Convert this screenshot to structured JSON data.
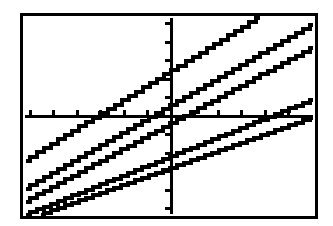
{
  "app": {
    "kind": "graphing-calculator-screen",
    "background_color": "#ffffff",
    "ink_color": "#000000",
    "frame_border_color": "#000000"
  },
  "screen": {
    "frame_left": 20,
    "frame_top": 13,
    "frame_width": 298,
    "frame_height": 206,
    "border_width": 3
  },
  "chart_data": {
    "type": "line",
    "title": "",
    "subtitle": "",
    "xlabel": "",
    "ylabel": "",
    "grid": false,
    "legend": "none",
    "axes": {
      "x_axis_visible": true,
      "y_axis_visible": true,
      "x_axis_pixel_y": 100,
      "y_axis_pixel_x": 148,
      "xlim": [
        -10,
        10
      ],
      "ylim": [
        -10,
        10
      ],
      "x_tick_step": 1.6,
      "y_tick_step": 1.9,
      "x_tick_count": 13,
      "y_tick_count": 11,
      "tick_length_px": 6
    },
    "series": [
      {
        "name": "line-1",
        "slope": 0.62,
        "intercept": 2.2,
        "px_start": [
          3,
          145
        ],
        "px_end": [
          237,
          2
        ],
        "exits": "right-edge-top"
      },
      {
        "name": "line-2",
        "slope": 0.62,
        "intercept": 0.45,
        "px_start": [
          3,
          173
        ],
        "px_end": [
          290,
          9
        ],
        "exits": "right-edge"
      },
      {
        "name": "line-3",
        "slope": 0.58,
        "intercept": -0.2,
        "px_start": [
          3,
          186
        ],
        "px_end": [
          290,
          32
        ],
        "exits": "right-edge"
      },
      {
        "name": "line-4",
        "slope": 0.52,
        "intercept": -1.6,
        "px_start": [
          3,
          199
        ],
        "px_end": [
          290,
          84
        ],
        "exits": "right-edge"
      },
      {
        "name": "line-5",
        "slope": 0.5,
        "intercept": -2.5,
        "px_start": [
          18,
          199
        ],
        "px_end": [
          290,
          102
        ],
        "exits": "right-edge"
      }
    ]
  }
}
